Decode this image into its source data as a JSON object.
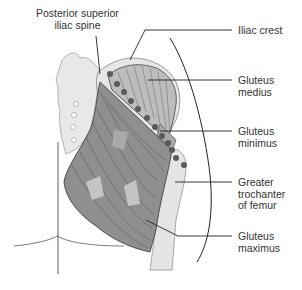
{
  "diagram": {
    "colors": {
      "background": "#ffffff",
      "outline": "#222222",
      "bone": "#e6e6e6",
      "muscle_maximus": "#8f8f8f",
      "muscle_medius": "#bdbdbd",
      "muscle_minimus": "#a8a8a8",
      "attachment_dot": "#5a5a5a",
      "label_text": "#333333"
    },
    "labels": [
      {
        "id": "posterior-superior-iliac-spine",
        "lines": [
          "Posterior superior",
          "iliac spine"
        ]
      },
      {
        "id": "iliac-crest",
        "lines": [
          "Iliac crest"
        ]
      },
      {
        "id": "gluteus-medius",
        "lines": [
          "Gluteus",
          "medius"
        ]
      },
      {
        "id": "gluteus-minimus",
        "lines": [
          "Gluteus",
          "minimus"
        ]
      },
      {
        "id": "greater-trochanter",
        "lines": [
          "Greater",
          "trochanter",
          "of femur"
        ]
      },
      {
        "id": "gluteus-maximus",
        "lines": [
          "Gluteus",
          "maximus"
        ]
      }
    ]
  }
}
